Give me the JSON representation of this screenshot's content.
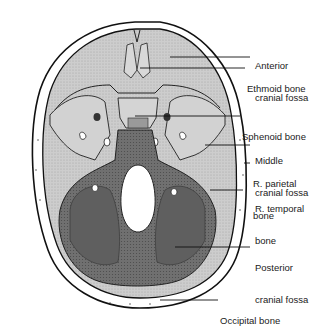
{
  "diagram": {
    "colors": {
      "background": "#ffffff",
      "skull_outline": "#111111",
      "light_fossa": "#cfcfcf",
      "mid_fossa": "#bdbdbd",
      "posterior_fossa": "#6e6e6e",
      "foramen": "#ffffff",
      "label_text": "#1a1a1a"
    },
    "labels": [
      {
        "id": "anterior-cranial-fossa",
        "line1": "Anterior",
        "line2": "cranial fossa"
      },
      {
        "id": "ethmoid-bone",
        "line1": "Ethmoid bone",
        "line2": ""
      },
      {
        "id": "sphenoid-bone",
        "line1": "Sphenoid bone",
        "line2": ""
      },
      {
        "id": "middle-cranial-fossa",
        "line1": "Middle",
        "line2": "cranial fossa"
      },
      {
        "id": "r-parietal-bone",
        "line1": "R. parietal",
        "line2": "bone"
      },
      {
        "id": "r-temporal-bone",
        "line1": "R. temporal",
        "line2": "bone"
      },
      {
        "id": "posterior-cranial-fossa",
        "line1": "Posterior",
        "line2": "cranial fossa"
      },
      {
        "id": "occipital-bone",
        "line1": "Occipital bone",
        "line2": ""
      }
    ]
  }
}
